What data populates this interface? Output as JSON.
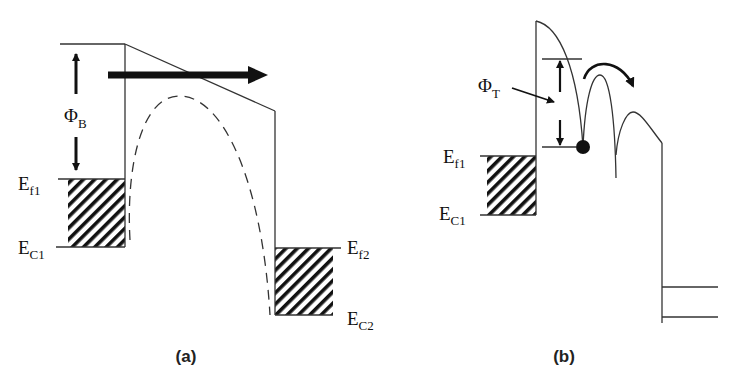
{
  "figure": {
    "panel_a": {
      "caption": "(a)",
      "labels": {
        "phi_b": {
          "main": "Φ",
          "sub": "B"
        },
        "ef1": {
          "main": "E",
          "sub": "f1"
        },
        "ec1": {
          "main": "E",
          "sub": "C1"
        },
        "ef2": {
          "main": "E",
          "sub": "f2"
        },
        "ec2": {
          "main": "E",
          "sub": "C2"
        }
      },
      "description": "Schottky barrier with thermionic emission over barrier (arrow) and dashed image-force lowered barrier profile"
    },
    "panel_b": {
      "caption": "(b)",
      "labels": {
        "phi_t": {
          "main": "Φ",
          "sub": "T"
        },
        "ef1": {
          "main": "E",
          "sub": "f1"
        },
        "ec1": {
          "main": "E",
          "sub": "C1"
        }
      },
      "description": "Trap-assisted hopping (Poole-Frenkel) with electron (dot) hopping over trap barriers"
    },
    "colors": {
      "line": "#333333",
      "fill": "#111111",
      "background": "#ffffff"
    }
  }
}
